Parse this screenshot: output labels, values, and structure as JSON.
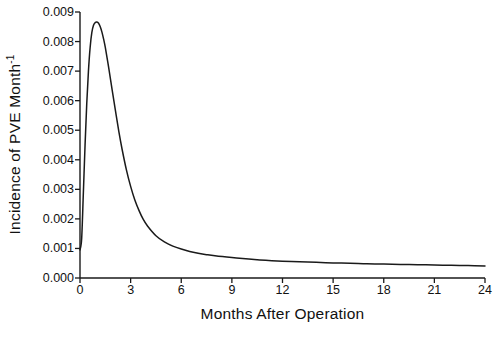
{
  "chart_data": {
    "type": "line",
    "title": "",
    "xlabel": "Months After Operation",
    "ylabel": "Incidence of PVE Month",
    "ylabel_exponent": "-1",
    "xlim": [
      0,
      24
    ],
    "ylim": [
      0,
      0.009
    ],
    "grid": false,
    "legend": null,
    "xticks": [
      "0",
      "3",
      "6",
      "9",
      "12",
      "15",
      "18",
      "21",
      "24"
    ],
    "xtick_values": [
      0,
      3,
      6,
      9,
      12,
      15,
      18,
      21,
      24
    ],
    "yticks": [
      "0.000",
      "0.001",
      "0.002",
      "0.003",
      "0.004",
      "0.005",
      "0.006",
      "0.007",
      "0.008",
      "0.009"
    ],
    "ytick_values": [
      0.0,
      0.001,
      0.002,
      0.003,
      0.004,
      0.005,
      0.006,
      0.007,
      0.008,
      0.009
    ],
    "series": [
      {
        "name": "Incidence of PVE",
        "color": "#1a1a1a",
        "x": [
          0.0,
          0.1,
          0.2,
          0.3,
          0.4,
          0.5,
          0.6,
          0.7,
          0.8,
          0.9,
          1.0,
          1.1,
          1.2,
          1.3,
          1.4,
          1.5,
          1.7,
          1.9,
          2.1,
          2.3,
          2.5,
          2.75,
          3.0,
          3.25,
          3.5,
          3.75,
          4.0,
          4.5,
          5.0,
          5.5,
          6.0,
          6.5,
          7.0,
          7.5,
          8.0,
          9.0,
          10.0,
          11.0,
          12.0,
          13.0,
          14.0,
          15.0,
          16.0,
          17.0,
          18.0,
          19.0,
          20.0,
          21.0,
          22.0,
          23.0,
          24.0
        ],
        "y": [
          0.00095,
          0.00135,
          0.0029,
          0.0045,
          0.0059,
          0.007,
          0.0078,
          0.0083,
          0.00855,
          0.00864,
          0.00866,
          0.00862,
          0.0085,
          0.00832,
          0.00808,
          0.0078,
          0.00712,
          0.00638,
          0.00566,
          0.00496,
          0.00434,
          0.00366,
          0.0031,
          0.00264,
          0.00228,
          0.00198,
          0.00176,
          0.00143,
          0.00122,
          0.00108,
          0.00098,
          0.0009,
          0.00084,
          0.00079,
          0.00075,
          0.00069,
          0.00064,
          0.0006,
          0.00057,
          0.00055,
          0.00053,
          0.00051,
          0.0005,
          0.00048,
          0.00047,
          0.00046,
          0.00045,
          0.00044,
          0.00043,
          0.00042,
          0.00041
        ]
      }
    ],
    "peak": {
      "x": 1.0,
      "y": 0.00866
    },
    "axis_color": "#1a1a1a"
  }
}
